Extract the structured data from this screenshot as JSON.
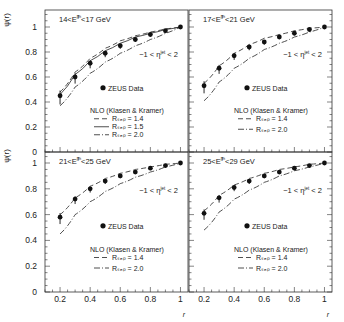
{
  "figure": {
    "ylabel": "ψ(r)",
    "xlabel": "r",
    "eta_cut": "−1 < ηᴶᵉᵗ < 2",
    "legend": {
      "data_label": "ZEUS Data",
      "nlo_title": "NLO (Klasen & Kramer)",
      "r14": "Rₛₑₚ = 1.4",
      "r15": "Rₛₑₚ = 1.5",
      "r20": "Rₛₑₚ = 2.0"
    }
  },
  "chart_data": [
    {
      "type": "line",
      "title": "14<E_T^jet<17 GeV",
      "xlabel": "r",
      "ylabel": "ψ(r)",
      "xlim": [
        0.1,
        1.05
      ],
      "ylim": [
        0,
        1.1
      ],
      "x": [
        0.2,
        0.3,
        0.4,
        0.5,
        0.6,
        0.7,
        0.8,
        0.9,
        1.0
      ],
      "series": [
        {
          "name": "ZEUS Data",
          "style": "points",
          "values": [
            0.45,
            0.6,
            0.71,
            0.79,
            0.85,
            0.9,
            0.94,
            0.97,
            1.0
          ]
        },
        {
          "name": "NLO R_sep = 1.4",
          "style": "dashed",
          "values": [
            0.48,
            0.64,
            0.75,
            0.83,
            0.89,
            0.93,
            0.96,
            0.985,
            1.0
          ]
        },
        {
          "name": "NLO R_sep = 1.5",
          "style": "solid",
          "values": [
            0.46,
            0.62,
            0.73,
            0.81,
            0.87,
            0.92,
            0.95,
            0.98,
            1.0
          ]
        },
        {
          "name": "NLO R_sep = 2.0",
          "style": "dashdot",
          "values": [
            0.37,
            0.52,
            0.63,
            0.72,
            0.79,
            0.85,
            0.9,
            0.95,
            1.0
          ]
        }
      ],
      "annotations": [
        "-1 < η^jet < 2",
        "ZEUS Data",
        "NLO (Klasen & Kramer)",
        "R_sep = 1.4",
        "R_sep = 1.5",
        "R_sep = 2.0"
      ]
    },
    {
      "type": "line",
      "title": "17<E_T^jet<21 GeV",
      "xlabel": "r",
      "ylabel": "ψ(r)",
      "xlim": [
        0.1,
        1.05
      ],
      "ylim": [
        0,
        1.1
      ],
      "x": [
        0.2,
        0.3,
        0.4,
        0.5,
        0.6,
        0.7,
        0.8,
        0.9,
        1.0
      ],
      "series": [
        {
          "name": "ZEUS Data",
          "style": "points",
          "values": [
            0.53,
            0.67,
            0.77,
            0.84,
            0.88,
            0.92,
            0.95,
            0.98,
            1.0
          ]
        },
        {
          "name": "NLO R_sep = 1.4",
          "style": "dashed",
          "values": [
            0.55,
            0.69,
            0.79,
            0.86,
            0.91,
            0.94,
            0.97,
            0.99,
            1.0
          ]
        },
        {
          "name": "NLO R_sep = 2.0",
          "style": "dashdot",
          "values": [
            0.41,
            0.56,
            0.67,
            0.75,
            0.82,
            0.87,
            0.92,
            0.96,
            1.0
          ]
        }
      ],
      "annotations": [
        "-1 < η^jet < 2",
        "ZEUS Data",
        "NLO (Klasen & Kramer)",
        "R_sep = 1.4",
        "R_sep = 2.0"
      ]
    },
    {
      "type": "line",
      "title": "21<E_T^jet<25 GeV",
      "xlabel": "r",
      "ylabel": "ψ(r)",
      "xlim": [
        0.1,
        1.05
      ],
      "ylim": [
        0,
        1.1
      ],
      "x": [
        0.2,
        0.3,
        0.4,
        0.5,
        0.6,
        0.7,
        0.8,
        0.9,
        1.0
      ],
      "series": [
        {
          "name": "ZEUS Data",
          "style": "points",
          "values": [
            0.58,
            0.72,
            0.8,
            0.86,
            0.9,
            0.93,
            0.96,
            0.98,
            1.0
          ]
        },
        {
          "name": "NLO R_sep = 1.4",
          "style": "dashed",
          "values": [
            0.6,
            0.73,
            0.82,
            0.88,
            0.92,
            0.95,
            0.97,
            0.99,
            1.0
          ]
        },
        {
          "name": "NLO R_sep = 2.0",
          "style": "dashdot",
          "values": [
            0.45,
            0.6,
            0.7,
            0.78,
            0.84,
            0.89,
            0.93,
            0.97,
            1.0
          ]
        }
      ],
      "annotations": [
        "-1 < η^jet < 2",
        "ZEUS Data",
        "NLO (Klasen & Kramer)",
        "R_sep = 1.4",
        "R_sep = 2.0"
      ]
    },
    {
      "type": "line",
      "title": "25<E_T^jet<29 GeV",
      "xlabel": "r",
      "ylabel": "ψ(r)",
      "xlim": [
        0.1,
        1.05
      ],
      "ylim": [
        0,
        1.1
      ],
      "x": [
        0.2,
        0.3,
        0.4,
        0.5,
        0.6,
        0.7,
        0.8,
        0.9,
        1.0
      ],
      "series": [
        {
          "name": "ZEUS Data",
          "style": "points",
          "values": [
            0.61,
            0.73,
            0.81,
            0.86,
            0.9,
            0.93,
            0.96,
            0.98,
            1.0
          ]
        },
        {
          "name": "NLO R_sep = 1.4",
          "style": "dashed",
          "values": [
            0.63,
            0.75,
            0.83,
            0.88,
            0.92,
            0.95,
            0.97,
            0.99,
            1.0
          ]
        },
        {
          "name": "NLO R_sep = 2.0",
          "style": "dashdot",
          "values": [
            0.48,
            0.62,
            0.72,
            0.79,
            0.85,
            0.9,
            0.94,
            0.97,
            1.0
          ]
        }
      ],
      "annotations": [
        "-1 < η^jet < 2",
        "ZEUS Data",
        "NLO (Klasen & Kramer)",
        "R_sep = 1.4",
        "R_sep = 2.0"
      ]
    }
  ],
  "axes": {
    "yticks": [
      "0",
      "0.2",
      "0.4",
      "0.6",
      "0.8",
      "1"
    ],
    "xticks": [
      "0.2",
      "0.4",
      "0.6",
      "0.8",
      "1"
    ]
  },
  "panels": [
    {
      "title_pre": "14<E",
      "title_post": "<17 GeV"
    },
    {
      "title_pre": "17<E",
      "title_post": "<21 GeV"
    },
    {
      "title_pre": "21<E",
      "title_post": "<25 GeV"
    },
    {
      "title_pre": "25<E",
      "title_post": "<29 GeV"
    }
  ]
}
